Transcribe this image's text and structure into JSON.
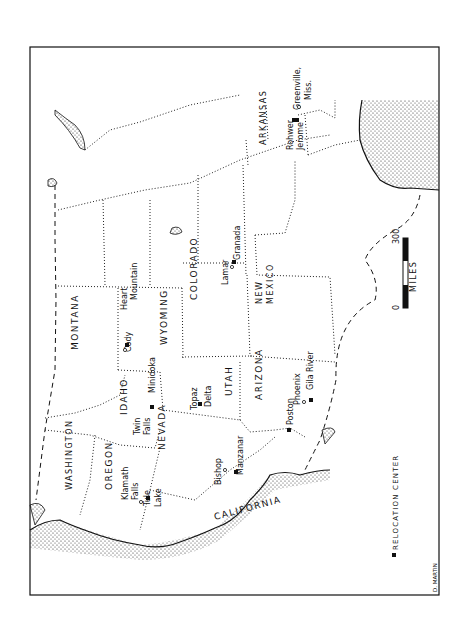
{
  "map": {
    "title": "Relocation Centers map (western United States, rotated)",
    "states": [
      {
        "name": "WASHINGTON",
        "x": 72,
        "y": 490,
        "rot": -90,
        "size": 8
      },
      {
        "name": "OREGON",
        "x": 112,
        "y": 490,
        "rot": -90,
        "size": 9
      },
      {
        "name": "CALIFORNIA",
        "x": 215,
        "y": 520,
        "rot": -15,
        "size": 9
      },
      {
        "name": "NEVADA",
        "x": 165,
        "y": 450,
        "rot": -90,
        "size": 9
      },
      {
        "name": "IDAHO",
        "x": 127,
        "y": 415,
        "rot": -90,
        "size": 9
      },
      {
        "name": "MONTANA",
        "x": 78,
        "y": 350,
        "rot": -90,
        "size": 9
      },
      {
        "name": "WYOMING",
        "x": 167,
        "y": 345,
        "rot": -90,
        "size": 9
      },
      {
        "name": "UTAH",
        "x": 232,
        "y": 396,
        "rot": -90,
        "size": 9
      },
      {
        "name": "COLORADO",
        "x": 197,
        "y": 300,
        "rot": -90,
        "size": 9
      },
      {
        "name": "ARIZONA",
        "x": 262,
        "y": 400,
        "rot": -90,
        "size": 9
      },
      {
        "name": "NEW",
        "x": 262,
        "y": 304,
        "rot": -90,
        "size": 8
      },
      {
        "name": "MEXICO",
        "x": 273,
        "y": 304,
        "rot": -90,
        "size": 8
      },
      {
        "name": "ARKANSAS",
        "x": 266,
        "y": 145,
        "rot": -90,
        "size": 8
      }
    ],
    "places": [
      {
        "name": "Cody",
        "x": 131,
        "y": 352,
        "rot": -90,
        "size": 8
      },
      {
        "name": "Heart",
        "x": 127,
        "y": 310,
        "rot": -90,
        "size": 8
      },
      {
        "name": "Mountain",
        "x": 137,
        "y": 300,
        "rot": -90,
        "size": 8
      },
      {
        "name": "Minidoka",
        "x": 155,
        "y": 393,
        "rot": -90,
        "size": 8
      },
      {
        "name": "Twin",
        "x": 140,
        "y": 435,
        "rot": -90,
        "size": 8
      },
      {
        "name": "Falls",
        "x": 150,
        "y": 435,
        "rot": -90,
        "size": 8
      },
      {
        "name": "Topaz",
        "x": 197,
        "y": 410,
        "rot": -90,
        "size": 8
      },
      {
        "name": "Delta",
        "x": 211,
        "y": 407,
        "rot": -90,
        "size": 8
      },
      {
        "name": "Lamar",
        "x": 228,
        "y": 285,
        "rot": -90,
        "size": 8
      },
      {
        "name": "Granada",
        "x": 240,
        "y": 260,
        "rot": -90,
        "size": 8
      },
      {
        "name": "Klamath",
        "x": 128,
        "y": 500,
        "rot": -90,
        "size": 8
      },
      {
        "name": "Falls",
        "x": 138,
        "y": 500,
        "rot": -90,
        "size": 8
      },
      {
        "name": "Tule",
        "x": 150,
        "y": 506,
        "rot": -90,
        "size": 8
      },
      {
        "name": "Lake",
        "x": 161,
        "y": 507,
        "rot": -90,
        "size": 8
      },
      {
        "name": "Bishop",
        "x": 221,
        "y": 485,
        "rot": -90,
        "size": 8
      },
      {
        "name": "Manzanar",
        "x": 243,
        "y": 475,
        "rot": -90,
        "size": 8
      },
      {
        "name": "Poston",
        "x": 293,
        "y": 425,
        "rot": -90,
        "size": 8
      },
      {
        "name": "Phoenix",
        "x": 300,
        "y": 405,
        "rot": -90,
        "size": 8
      },
      {
        "name": "Gila River",
        "x": 313,
        "y": 390,
        "rot": -90,
        "size": 8
      },
      {
        "name": "Rohwer",
        "x": 293,
        "y": 150,
        "rot": -90,
        "size": 8
      },
      {
        "name": "Jerome",
        "x": 303,
        "y": 150,
        "rot": -90,
        "size": 8
      },
      {
        "name": "Greenville,",
        "x": 300,
        "y": 110,
        "rot": -90,
        "size": 8
      },
      {
        "name": "Miss.",
        "x": 311,
        "y": 100,
        "rot": -90,
        "size": 8
      }
    ],
    "centers": [
      {
        "x": 127,
        "y": 345
      },
      {
        "x": 152,
        "y": 407
      },
      {
        "x": 200,
        "y": 404
      },
      {
        "x": 234,
        "y": 262
      },
      {
        "x": 148,
        "y": 498
      },
      {
        "x": 236,
        "y": 472
      },
      {
        "x": 289,
        "y": 430
      },
      {
        "x": 311,
        "y": 400
      },
      {
        "x": 294,
        "y": 120
      },
      {
        "x": 297,
        "y": 120
      }
    ],
    "towns": [
      {
        "x": 225,
        "y": 470
      },
      {
        "x": 232,
        "y": 267
      },
      {
        "x": 304,
        "y": 402
      },
      {
        "x": 141,
        "y": 502
      },
      {
        "x": 299,
        "y": 107
      },
      {
        "x": 125,
        "y": 350
      }
    ],
    "scale": {
      "zero": "0",
      "max": "300",
      "unit": "MILES"
    },
    "legend": {
      "label": "RELOCATION CENTER"
    },
    "credit": "D. MARTIN"
  }
}
